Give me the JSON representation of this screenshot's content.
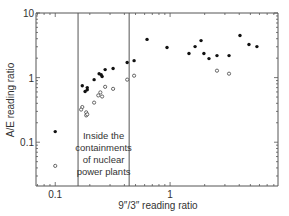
{
  "chart_data": {
    "type": "scatter",
    "title": "",
    "xlabel": "9″/3″ reading ratio",
    "ylabel": "A/E reading ratio",
    "xscale": "log",
    "yscale": "log",
    "xlim": [
      0.068,
      8.7
    ],
    "ylim": [
      0.021,
      10
    ],
    "x_ticks": [
      {
        "value": 0.1,
        "label": "0.1"
      },
      {
        "value": 1,
        "label": "1"
      }
    ],
    "y_ticks": [
      {
        "value": 0.1,
        "label": "0.1"
      },
      {
        "value": 1,
        "label": "1"
      },
      {
        "value": 10,
        "label": "10"
      }
    ],
    "grid": false,
    "legend": null,
    "region": {
      "x_range": [
        0.158,
        0.44
      ],
      "annotation_lines": [
        "Inside the",
        "containments",
        "of nuclear",
        "power plants"
      ]
    },
    "series": [
      {
        "name": "filled",
        "marker": "filled-circle",
        "points": [
          [
            0.1,
            0.146
          ],
          [
            0.172,
            0.75
          ],
          [
            0.182,
            0.61
          ],
          [
            0.19,
            0.7
          ],
          [
            0.19,
            0.65
          ],
          [
            0.218,
            0.93
          ],
          [
            0.241,
            1.15
          ],
          [
            0.251,
            1.11
          ],
          [
            0.256,
            1.04
          ],
          [
            0.272,
            1.33
          ],
          [
            0.319,
            1.38
          ],
          [
            0.423,
            1.71
          ],
          [
            0.486,
            1.83
          ],
          [
            0.63,
            3.9
          ],
          [
            0.94,
            2.92
          ],
          [
            1.46,
            2.36
          ],
          [
            1.65,
            3.02
          ],
          [
            1.86,
            3.74
          ],
          [
            1.97,
            2.36
          ],
          [
            2.18,
            1.97
          ],
          [
            2.56,
            2.19
          ],
          [
            3.26,
            2.19
          ],
          [
            4.06,
            4.48
          ],
          [
            4.86,
            3.25
          ],
          [
            5.7,
            3.02
          ]
        ]
      },
      {
        "name": "open",
        "marker": "open-circle",
        "points": [
          [
            0.1,
            0.043
          ],
          [
            0.423,
            0.93
          ],
          [
            0.486,
            1.07
          ],
          [
            0.272,
            0.72
          ],
          [
            0.319,
            0.67
          ],
          [
            0.247,
            0.59
          ],
          [
            0.237,
            0.53
          ],
          [
            0.256,
            0.51
          ],
          [
            0.218,
            0.41
          ],
          [
            0.172,
            0.35
          ],
          [
            0.168,
            0.32
          ],
          [
            0.186,
            0.29
          ],
          [
            0.186,
            0.26
          ],
          [
            0.19,
            0.27
          ],
          [
            2.56,
            1.28
          ],
          [
            3.26,
            1.15
          ]
        ]
      }
    ]
  }
}
